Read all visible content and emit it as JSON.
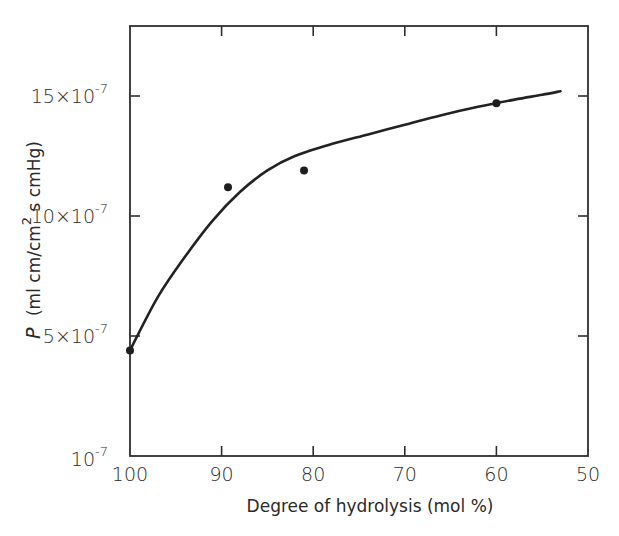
{
  "chart_data": {
    "type": "scatter",
    "title": "",
    "xlabel": "Degree of hydrolysis (mol %)",
    "ylabel_prefix": "P",
    "ylabel_units": "(ml cm/cm",
    "ylabel_sup": "2",
    "ylabel_units_tail": " s cmHg)",
    "ylabel": "P (ml cm/cm2 s cmHg)",
    "x_axis": {
      "reversed": true,
      "range": [
        100,
        50
      ],
      "ticks": [
        100,
        90,
        80,
        70,
        60,
        50
      ],
      "tick_labels": [
        "100",
        "90",
        "80",
        "70",
        "60",
        "50"
      ]
    },
    "y_axis": {
      "range": [
        0,
        18
      ],
      "unit": "x10^-7",
      "ticks": [
        {
          "value": 0,
          "base": "10",
          "exp": "-7",
          "label": "10-7"
        },
        {
          "value": 5,
          "base": "5×10",
          "exp": "-7",
          "label": "5x10-7"
        },
        {
          "value": 10,
          "base": "10×10",
          "exp": "-7",
          "label": "10x10-7"
        },
        {
          "value": 15,
          "base": "15×10",
          "exp": "-7",
          "label": "15x10-7"
        }
      ]
    },
    "grid": false,
    "legend": null,
    "series": [
      {
        "name": "measured",
        "style": "markers",
        "x": [
          100,
          89.3,
          81,
          60
        ],
        "y": [
          4.4,
          11.2,
          11.9,
          14.7
        ]
      },
      {
        "name": "fitted curve",
        "style": "line",
        "x": [
          100,
          97,
          94,
          91,
          88,
          85,
          82,
          78,
          74,
          70,
          66,
          62,
          58,
          55,
          53
        ],
        "y": [
          4.4,
          6.6,
          8.3,
          9.8,
          11.0,
          11.9,
          12.5,
          13.0,
          13.4,
          13.8,
          14.2,
          14.55,
          14.85,
          15.05,
          15.2
        ]
      }
    ]
  }
}
